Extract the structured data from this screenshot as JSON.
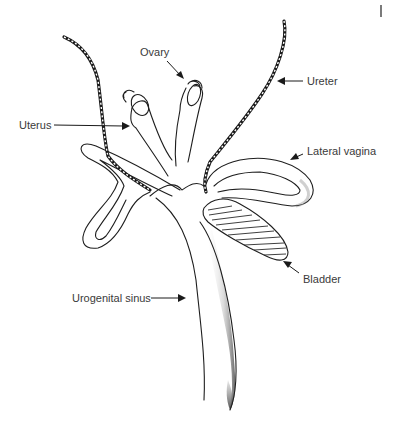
{
  "figure": {
    "type": "anatomical line drawing",
    "labels": {
      "ovary": "Ovary",
      "uterus": "Uterus",
      "ureter": "Ureter",
      "lateral_vagina": "Lateral vagina",
      "bladder": "Bladder",
      "urogenital_sinus": "Urogenital sinus"
    },
    "colors": {
      "ink": "#1e1e1e",
      "label_text": "#3a3a3a",
      "background": "#ffffff",
      "shading": "#6a6a6a"
    }
  }
}
